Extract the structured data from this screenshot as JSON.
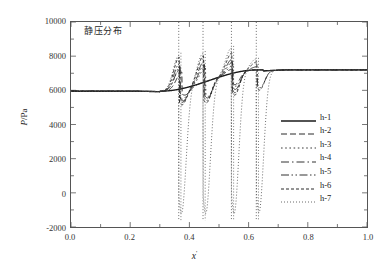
{
  "chart_data": {
    "type": "line",
    "title": "",
    "annotation": "静压分布",
    "xlabel": "x'",
    "xlabel_base": "x",
    "xlabel_prime": "'",
    "ylabel": "P/Pa",
    "ylabel_numerator": "P",
    "ylabel_denominator": "/Pa",
    "xlim": [
      0.0,
      1.0
    ],
    "ylim": [
      -2000,
      10000
    ],
    "xticks": [
      0.0,
      0.2,
      0.4,
      0.6,
      0.8,
      1.0
    ],
    "xtick_labels": [
      "0.0",
      "0.2",
      "0.4",
      "0.6",
      "0.8",
      "1.0"
    ],
    "yticks": [
      -2000,
      0,
      2000,
      4000,
      6000,
      8000,
      10000
    ],
    "ytick_labels": [
      "-2000",
      "0",
      "2000",
      "4000",
      "6000",
      "8000",
      "10000"
    ],
    "minor_ticks": true,
    "grid": false,
    "legend_position": "center-right",
    "inlet_pressure": 5950,
    "outlet_pressure": 7200,
    "shock_region_start": 0.3,
    "shock_region_end": 0.65,
    "series": [
      {
        "name": "h-1",
        "linestyle": "solid",
        "dasharray": "",
        "width": 1.4,
        "color": "#1a1a1a",
        "shock_count": 0,
        "peak_max": 7200,
        "peak_min": 5900,
        "shocks": []
      },
      {
        "name": "h-2",
        "linestyle": "dashed",
        "dasharray": "6,3",
        "width": 1.0,
        "color": "#2a2a2a",
        "shock_count": 2,
        "peak_max": 7300,
        "peak_min": 5700,
        "shocks": [
          {
            "x": 0.375,
            "high": 7150,
            "low": 5700
          },
          {
            "x": 0.545,
            "high": 7250,
            "low": 6300
          }
        ]
      },
      {
        "name": "h-3",
        "linestyle": "dotted",
        "dasharray": "1.6,2.6",
        "width": 1.0,
        "color": "#3a3a3a",
        "shock_count": 3,
        "peak_max": 7600,
        "peak_min": 5400,
        "shocks": [
          {
            "x": 0.368,
            "high": 7300,
            "low": 5450
          },
          {
            "x": 0.455,
            "high": 7400,
            "low": 5600
          },
          {
            "x": 0.548,
            "high": 7500,
            "low": 6200
          }
        ]
      },
      {
        "name": "h-4",
        "linestyle": "dashdot",
        "dasharray": "8,3,1.5,3",
        "width": 1.0,
        "color": "#333333",
        "shock_count": 3,
        "peak_max": 7800,
        "peak_min": 5300,
        "shocks": [
          {
            "x": 0.37,
            "high": 7500,
            "low": 5350
          },
          {
            "x": 0.452,
            "high": 7600,
            "low": 5500
          },
          {
            "x": 0.546,
            "high": 7700,
            "low": 6000
          }
        ]
      },
      {
        "name": "h-5",
        "linestyle": "dashdotdot",
        "dasharray": "8,2.5,1.5,2.5,1.5,2.5",
        "width": 1.0,
        "color": "#333333",
        "shock_count": 4,
        "peak_max": 8000,
        "peak_min": 5200,
        "shocks": [
          {
            "x": 0.367,
            "high": 7700,
            "low": 5250
          },
          {
            "x": 0.45,
            "high": 7800,
            "low": 5350
          },
          {
            "x": 0.545,
            "high": 7900,
            "low": 5800
          },
          {
            "x": 0.63,
            "high": 7400,
            "low": 6100
          }
        ]
      },
      {
        "name": "h-6",
        "linestyle": "densedashed",
        "dasharray": "3,2",
        "width": 1.0,
        "color": "#2a2a2a",
        "shock_count": 4,
        "peak_max": 8300,
        "peak_min": 5050,
        "shocks": [
          {
            "x": 0.366,
            "high": 8100,
            "low": 5100
          },
          {
            "x": 0.448,
            "high": 8150,
            "low": 5200
          },
          {
            "x": 0.544,
            "high": 8300,
            "low": 5650
          },
          {
            "x": 0.628,
            "high": 7700,
            "low": 5950
          }
        ]
      },
      {
        "name": "h-7",
        "linestyle": "finedotted",
        "dasharray": "1,2",
        "width": 0.9,
        "color": "#5a5a5a",
        "shock_count": 4,
        "peak_max": 8600,
        "peak_min": -1650,
        "shocks": [
          {
            "x": 0.364,
            "high": 8200,
            "low": -1600,
            "spike_top": 10000,
            "spike_bottom": -1600
          },
          {
            "x": 0.446,
            "high": 8300,
            "low": -1620,
            "spike_top": 10000,
            "spike_bottom": -1620
          },
          {
            "x": 0.542,
            "high": 8600,
            "low": -1650,
            "spike_top": 10000,
            "spike_bottom": -1650
          },
          {
            "x": 0.626,
            "high": 7900,
            "low": -1600,
            "spike_top": 10000,
            "spike_bottom": -1600
          }
        ]
      }
    ]
  }
}
